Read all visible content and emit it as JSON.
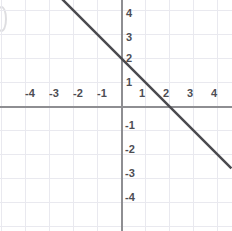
{
  "figure": {
    "name": "cartesian-line-graph",
    "background_color": "#ffffff",
    "grid_color": "#e9e9ef",
    "axis_color": "#8e8e92",
    "line_color": "#4a4a4f",
    "label_color": "#4d4d53",
    "edge_mark_label": ")"
  },
  "chart_data": {
    "type": "line",
    "title": "",
    "xlabel": "",
    "ylabel": "",
    "xlim": [
      -4.9,
      4.6
    ],
    "ylim": [
      -4.8,
      4.7
    ],
    "grid": true,
    "grid_step": 1,
    "legend": "none",
    "x_ticks": [
      -4,
      -3,
      -2,
      -1,
      1,
      2,
      3,
      4
    ],
    "y_ticks": [
      4,
      3,
      2,
      1,
      -1,
      -2,
      -3,
      -4
    ],
    "x_tick_labels": [
      "-4",
      "-3",
      "-2",
      "-1",
      "1",
      "2",
      "3",
      "4"
    ],
    "y_tick_labels": [
      "4",
      "3",
      "2",
      "1",
      "-1",
      "-2",
      "-3",
      "-4"
    ],
    "series": [
      {
        "name": "line",
        "equation": "y = -x + 2",
        "slope": -1,
        "intercept": 2,
        "x": [
          -2.8,
          4.6
        ],
        "y": [
          4.8,
          -2.6
        ],
        "key_points": [
          {
            "label": "y-intercept",
            "x": 0,
            "y": 2
          },
          {
            "label": "x-intercept",
            "x": 2,
            "y": 0
          }
        ],
        "color": "#4a4a4f",
        "width": 2.5
      }
    ]
  },
  "axes_pixels": {
    "origin_x": 121,
    "origin_y": 106,
    "unit": 24
  },
  "x_tick_positions": [
    {
      "label": "-4",
      "left": 30,
      "top": 88
    },
    {
      "label": "-3",
      "left": 54,
      "top": 88
    },
    {
      "label": "-2",
      "left": 78,
      "top": 88
    },
    {
      "label": "-1",
      "left": 102,
      "top": 88
    },
    {
      "label": "1",
      "left": 142,
      "top": 88
    },
    {
      "label": "2",
      "left": 166,
      "top": 88
    },
    {
      "label": "3",
      "left": 190,
      "top": 88
    },
    {
      "label": "4",
      "left": 214,
      "top": 88
    }
  ],
  "y_tick_positions": [
    {
      "label": "4",
      "left": 126,
      "top": 8
    },
    {
      "label": "3",
      "left": 126,
      "top": 32
    },
    {
      "label": "2",
      "left": 126,
      "top": 53
    },
    {
      "label": "1",
      "left": 126,
      "top": 77
    },
    {
      "label": "-1",
      "left": 125,
      "top": 120
    },
    {
      "label": "-2",
      "left": 125,
      "top": 144
    },
    {
      "label": "-3",
      "left": 125,
      "top": 168
    },
    {
      "label": "-4",
      "left": 125,
      "top": 192
    }
  ],
  "gridlines": {
    "vertical_x": [
      1,
      25,
      49,
      73,
      97,
      145,
      169,
      193,
      217
    ],
    "horizontal_y": [
      10,
      34,
      58,
      82,
      130,
      154,
      178,
      202,
      226
    ]
  }
}
